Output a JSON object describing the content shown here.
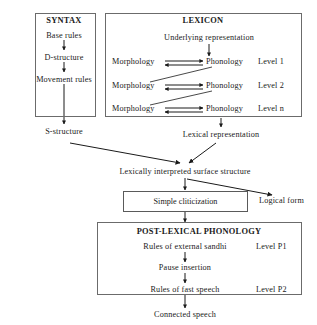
{
  "diagram": {
    "line_color": "#1a1a1a",
    "box_border_color": "#5a5a5a",
    "background": "#ffffff"
  },
  "syntax_box": {
    "header": "SYNTAX",
    "steps": [
      "Base rules",
      "D-structure",
      "Movement rules"
    ],
    "output": "S-structure"
  },
  "lexicon_box": {
    "header": "LEXICON",
    "input": "Underlying representation",
    "levels": [
      {
        "morphology": "Morphology",
        "phonology": "Phonology",
        "level": "Level 1"
      },
      {
        "morphology": "Morphology",
        "phonology": "Phonology",
        "level": "Level 2"
      },
      {
        "morphology": "Morphology",
        "phonology": "Phonology",
        "level": "Level n"
      }
    ],
    "output": "Lexical representation"
  },
  "middle": {
    "surface_structure": "Lexically interpreted surface structure",
    "cliticization_box": "Simple cliticization",
    "logical_form": "Logical form"
  },
  "postlexical_box": {
    "header": "POST-LEXICAL PHONOLOGY",
    "steps": [
      {
        "label": "Rules of external sandhi",
        "level": "Level P1"
      },
      {
        "label": "Pause insertion",
        "level": ""
      },
      {
        "label": "Rules of fast speech",
        "level": "Level P2"
      }
    ],
    "output": "Connected speech"
  }
}
